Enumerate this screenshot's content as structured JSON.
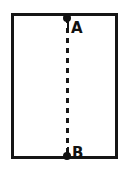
{
  "figure": {
    "type": "line-diagram",
    "background_color": "#ffffff",
    "ink_color": "#151515",
    "box": {
      "name": "rectangle-outline",
      "stroke_width_px": 3,
      "left_px": 11,
      "top_px": 13,
      "width_px": 107,
      "height_px": 146
    },
    "dashed_line": {
      "name": "dashed-path-AB",
      "orientation": "vertical",
      "x_px": 67,
      "from_y_px": 18,
      "to_y_px": 156,
      "dash_length_px": 5,
      "gap_length_px": 5,
      "stroke_width_px": 3
    },
    "points": [
      {
        "id": "A",
        "label": "A",
        "marker": "filled-dot",
        "x_px": 67,
        "y_px": 18,
        "location": "top edge of rectangle",
        "label_offset": "right of dot"
      },
      {
        "id": "B",
        "label": "B",
        "marker": "filled-dot",
        "x_px": 67,
        "y_px": 156,
        "location": "bottom edge of rectangle",
        "label_offset": "right of dot"
      }
    ]
  }
}
